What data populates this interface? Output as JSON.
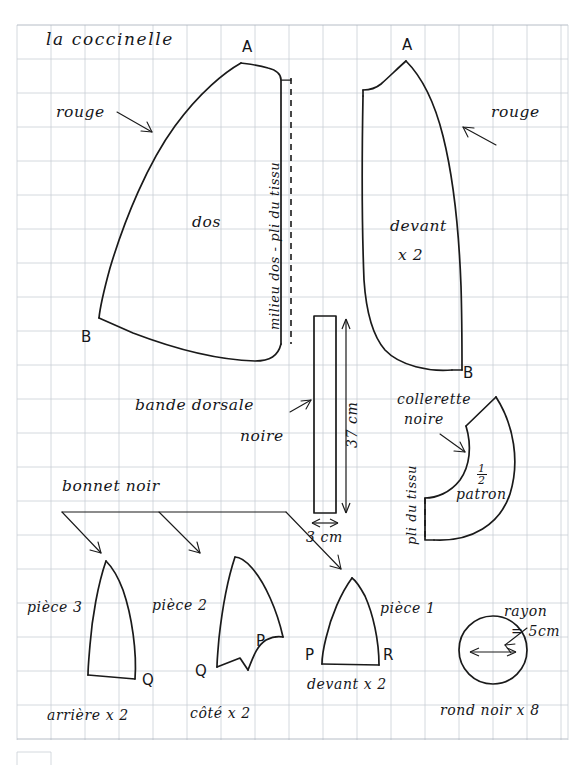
{
  "document": {
    "title": "la coccinelle",
    "medium": "hand-drawn sewing pattern on graph paper",
    "background_color": "#ffffff",
    "grid_color": "#c9cfd6",
    "ink_color": "#1a1a1a"
  },
  "pieces": {
    "dos": {
      "label": "dos",
      "fabric_note": "rouge",
      "fold_note": "milieu dos - pli du tissu",
      "point_top": "A",
      "point_bottom": "B"
    },
    "devant": {
      "label": "devant",
      "quantity": "x 2",
      "fabric_note": "rouge",
      "point_top": "A",
      "point_bottom": "B"
    },
    "bande_dorsale": {
      "label_line1": "bande dorsale",
      "label_line2": "noire",
      "height_dim": "37 cm",
      "width_dim": "3 cm"
    },
    "collerette": {
      "label_line1": "collerette",
      "label_line2": "noire",
      "half_pattern_numerator": "1",
      "half_pattern_denominator": "2",
      "half_pattern_word": "patron",
      "fold_note": "pli du tissu"
    },
    "bonnet": {
      "group_label": "bonnet noir",
      "piece3": {
        "label": "pièce 3",
        "caption": "arrière x 2",
        "point_right": "Q"
      },
      "piece2": {
        "label": "pièce 2",
        "caption": "côté x 2",
        "point_left": "Q",
        "point_right": "P"
      },
      "piece1": {
        "label": "pièce 1",
        "caption": "devant x 2",
        "point_left": "P",
        "point_right": "R"
      }
    },
    "rond_noir": {
      "caption": "rond noir x 8",
      "radius_label_line1": "rayon",
      "radius_label_line2": "= 5cm"
    }
  }
}
